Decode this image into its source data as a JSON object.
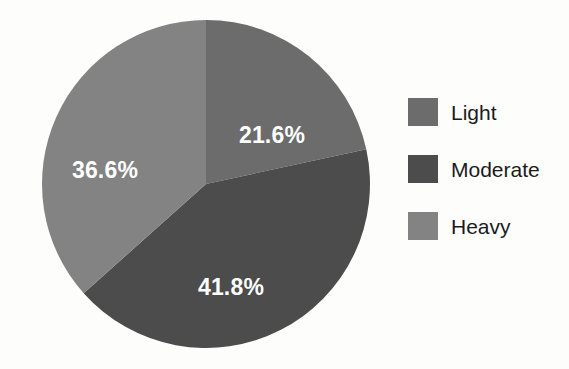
{
  "chart_data": {
    "type": "pie",
    "title": "",
    "subtitle": "",
    "categories": [
      "Light",
      "Moderate",
      "Heavy"
    ],
    "values": [
      21.6,
      41.8,
      36.6
    ],
    "value_unit": "%",
    "data_labels": [
      "21.6%",
      "41.8%",
      "36.6%"
    ],
    "colors": [
      "#6c6c6c",
      "#4c4c4c",
      "#838383"
    ],
    "label_color": "#ffffff",
    "background_color": "#fdfdfb",
    "start_angle_deg": 0,
    "direction": "clockwise",
    "legend": {
      "position": "right",
      "entries": [
        {
          "label": "Light",
          "color": "#6c6c6c",
          "value": 21.6,
          "data_label": "21.6%"
        },
        {
          "label": "Moderate",
          "color": "#4c4c4c",
          "value": 41.8,
          "data_label": "41.8%"
        },
        {
          "label": "Heavy",
          "color": "#838383",
          "value": 36.6,
          "data_label": "36.6%"
        }
      ]
    },
    "grid": false,
    "xlabel": "",
    "ylabel": ""
  },
  "geometry": {
    "center_x": 206,
    "center_y": 184,
    "radius": 164,
    "label_positions": [
      {
        "x": 272,
        "y": 137
      },
      {
        "x": 231,
        "y": 289
      },
      {
        "x": 105,
        "y": 172
      }
    ]
  }
}
